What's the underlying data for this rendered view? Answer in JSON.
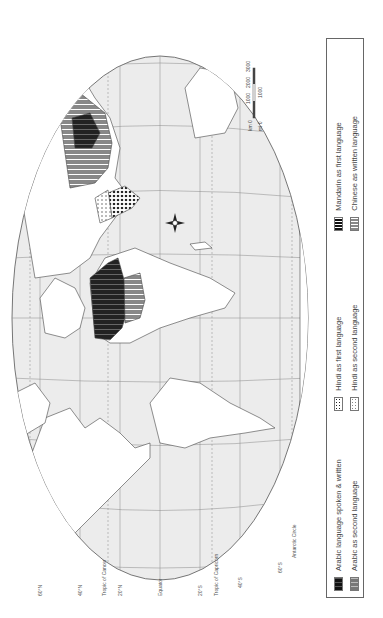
{
  "map": {
    "projection": "world map (rotated 90°)",
    "latitude_labels": [
      "60°N",
      "40°N",
      "Tropic of Cancer",
      "20°N",
      "Equator",
      "20°S",
      "Tropic of Capricorn",
      "40°S",
      "60°S",
      "Antarctic Circle"
    ],
    "scale_bar": {
      "km_label": "km 0",
      "km_ticks": [
        "1000",
        "2000",
        "3000"
      ],
      "mi_label": "mi 0",
      "mi_ticks": [
        "1000"
      ]
    },
    "compass": "compass-rose"
  },
  "legend": {
    "items": [
      {
        "label": "Arabic language spoken & written",
        "pattern": "arabic-spoken",
        "color": "#1a1a1a"
      },
      {
        "label": "Hindi as first language",
        "pattern": "hindi-first",
        "color": "#333333"
      },
      {
        "label": "Mandarin as first language",
        "pattern": "mandarin-first",
        "color": "#222222"
      },
      {
        "label": "Arabic as second language",
        "pattern": "arabic-second",
        "color": "#777777"
      },
      {
        "label": "Hindi as second language",
        "pattern": "hindi-second",
        "color": "#999999"
      },
      {
        "label": "Chinese as written language",
        "pattern": "chinese-written",
        "color": "#888888"
      }
    ]
  },
  "caption": ""
}
